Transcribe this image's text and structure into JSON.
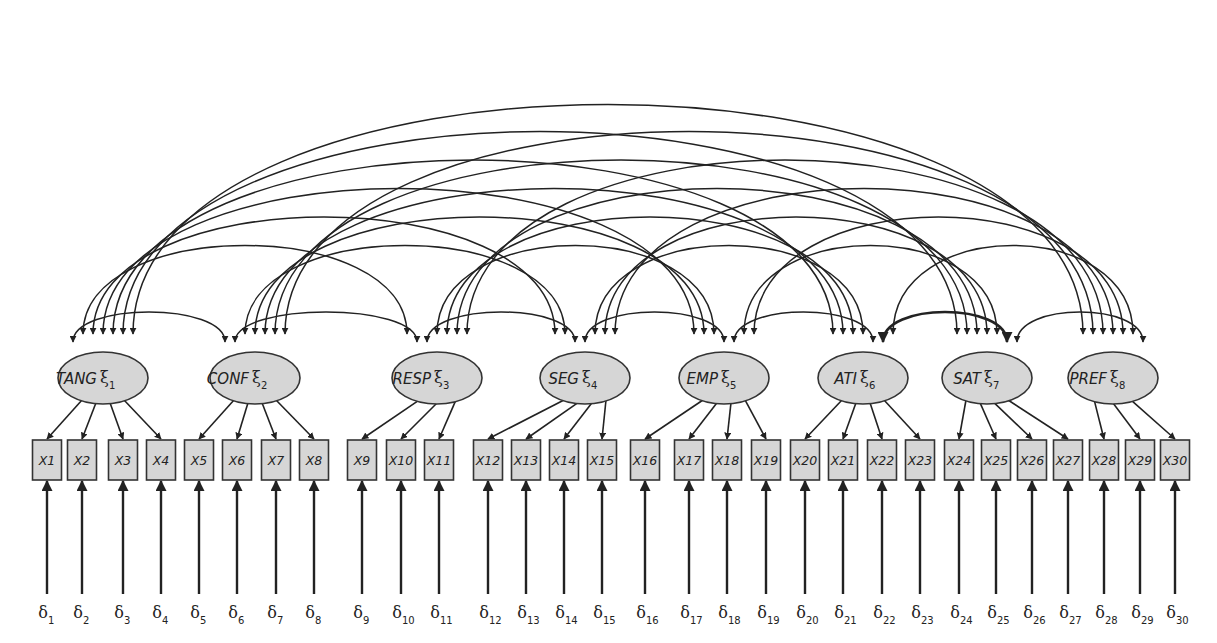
{
  "factors": [
    {
      "id": 1,
      "name": "TANG",
      "symbol": "ξ",
      "index": "1",
      "indicators": [
        1,
        2,
        3,
        4
      ]
    },
    {
      "id": 2,
      "name": "CONF",
      "symbol": "ξ",
      "index": "2",
      "indicators": [
        5,
        6,
        7,
        8
      ]
    },
    {
      "id": 3,
      "name": "RESP",
      "symbol": "ξ",
      "index": "3",
      "indicators": [
        9,
        10,
        11
      ]
    },
    {
      "id": 4,
      "name": "SEG",
      "symbol": "ξ",
      "index": "4",
      "indicators": [
        12,
        13,
        14,
        15
      ]
    },
    {
      "id": 5,
      "name": "EMP",
      "symbol": "ξ",
      "index": "5",
      "indicators": [
        16,
        17,
        18,
        19
      ]
    },
    {
      "id": 6,
      "name": "ATI",
      "symbol": "ξ",
      "index": "6",
      "indicators": [
        20,
        21,
        22,
        23
      ]
    },
    {
      "id": 7,
      "name": "SAT",
      "symbol": "ξ",
      "index": "7",
      "indicators": [
        24,
        25,
        26,
        27
      ]
    },
    {
      "id": 8,
      "name": "PREF",
      "symbol": "ξ",
      "index": "8",
      "indicators": [
        28,
        29,
        30
      ]
    }
  ],
  "indicators": [
    {
      "label": "X1",
      "error": "δ",
      "error_index": "1"
    },
    {
      "label": "X2",
      "error": "δ",
      "error_index": "2"
    },
    {
      "label": "X3",
      "error": "δ",
      "error_index": "3"
    },
    {
      "label": "X4",
      "error": "δ",
      "error_index": "4"
    },
    {
      "label": "X5",
      "error": "δ",
      "error_index": "5"
    },
    {
      "label": "X6",
      "error": "δ",
      "error_index": "6"
    },
    {
      "label": "X7",
      "error": "δ",
      "error_index": "7"
    },
    {
      "label": "X8",
      "error": "δ",
      "error_index": "8"
    },
    {
      "label": "X9",
      "error": "δ",
      "error_index": "9"
    },
    {
      "label": "X10",
      "error": "δ",
      "error_index": "10"
    },
    {
      "label": "X11",
      "error": "δ",
      "error_index": "11"
    },
    {
      "label": "X12",
      "error": "δ",
      "error_index": "12"
    },
    {
      "label": "X13",
      "error": "δ",
      "error_index": "13"
    },
    {
      "label": "X14",
      "error": "δ",
      "error_index": "14"
    },
    {
      "label": "X15",
      "error": "δ",
      "error_index": "15"
    },
    {
      "label": "X16",
      "error": "δ",
      "error_index": "16"
    },
    {
      "label": "X17",
      "error": "δ",
      "error_index": "17"
    },
    {
      "label": "X18",
      "error": "δ",
      "error_index": "18"
    },
    {
      "label": "X19",
      "error": "δ",
      "error_index": "19"
    },
    {
      "label": "X20",
      "error": "δ",
      "error_index": "20"
    },
    {
      "label": "X21",
      "error": "δ",
      "error_index": "21"
    },
    {
      "label": "X22",
      "error": "δ",
      "error_index": "22"
    },
    {
      "label": "X23",
      "error": "δ",
      "error_index": "23"
    },
    {
      "label": "X24",
      "error": "δ",
      "error_index": "24"
    },
    {
      "label": "X25",
      "error": "δ",
      "error_index": "25"
    },
    {
      "label": "X26",
      "error": "δ",
      "error_index": "26"
    },
    {
      "label": "X27",
      "error": "δ",
      "error_index": "27"
    },
    {
      "label": "X28",
      "error": "δ",
      "error_index": "28"
    },
    {
      "label": "X29",
      "error": "δ",
      "error_index": "29"
    },
    {
      "label": "X30",
      "error": "δ",
      "error_index": "30"
    }
  ],
  "covariances": "all factor pairs correlated (28 double-headed arcs)",
  "colors": {
    "node_fill": "#d6d6d6",
    "stroke": "#222222"
  }
}
